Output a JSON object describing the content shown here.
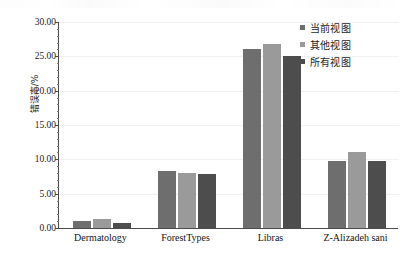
{
  "chart_data": {
    "type": "bar",
    "title": "",
    "xlabel": "",
    "ylabel": "错误率/%",
    "ylim": [
      0,
      30
    ],
    "ytick_step": 5,
    "ytick_labels": [
      "0.00",
      "5.00",
      "10.00",
      "15.00",
      "20.00",
      "25.00",
      "30.00"
    ],
    "ytick_values": [
      0,
      5,
      10,
      15,
      20,
      25,
      30
    ],
    "grid": true,
    "legend_position": "top-right",
    "categories": [
      "Dermatology",
      "ForestTypes",
      "Libras",
      "Z-Alizadeh sani"
    ],
    "series": [
      {
        "name": "当前视图",
        "color": "#6e6e6e",
        "values": [
          1.0,
          8.3,
          26.1,
          9.7
        ]
      },
      {
        "name": "其他视图",
        "color": "#9a9a9a",
        "values": [
          1.3,
          8.0,
          26.8,
          11.1
        ]
      },
      {
        "name": "所有视图",
        "color": "#4d4d4d",
        "values": [
          0.7,
          7.8,
          25.0,
          9.7
        ]
      }
    ]
  },
  "axis": {
    "line_color": "#4a4a4a",
    "grid_color": "#f1f1f1"
  },
  "legend": {
    "entries": [
      {
        "label": "当前视图",
        "color": "#6e6e6e",
        "swatch": "square-marker-icon"
      },
      {
        "label": "其他视图",
        "color": "#9a9a9a",
        "swatch": "square-marker-icon"
      },
      {
        "label": "所有视图",
        "color": "#4d4d4d",
        "swatch": "square-marker-icon"
      }
    ]
  }
}
